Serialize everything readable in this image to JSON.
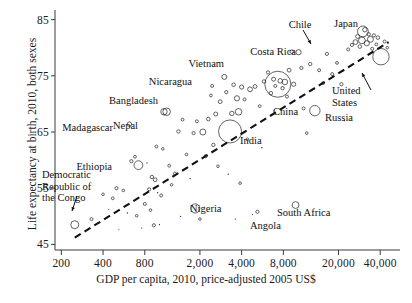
{
  "chart_data": {
    "type": "scatter",
    "title": "",
    "xlabel": "GDP per capita, 2010, price-adjusted 2005 US$",
    "ylabel": "Life expectancy at birth, 2010, both sexes",
    "xscale": "log",
    "xlim": [
      180,
      52000
    ],
    "ylim": [
      44,
      86
    ],
    "xticks": [
      200,
      400,
      800,
      2000,
      4000,
      8000,
      20000,
      40000
    ],
    "xtick_labels": [
      "200",
      "400",
      "800",
      "2,000",
      "4,000",
      "8,000",
      "20,000",
      "40,000"
    ],
    "yticks": [
      45,
      55,
      65,
      75,
      85
    ],
    "ytick_labels": [
      "45",
      "55",
      "65",
      "75",
      "85"
    ],
    "grid": false,
    "legend": null,
    "marker": "open-circle",
    "marker_size_encodes": "population",
    "trendline": {
      "style": "dashed",
      "color": "#111111",
      "x_start": 250,
      "y_start": 46.2,
      "x_end": 46000,
      "y_end": 81.0
    },
    "annotations": [
      {
        "label": "Madagascar",
        "x": 900,
        "y": 66.2,
        "align": "right",
        "leader": false
      },
      {
        "label": "Ethiopia",
        "x": 780,
        "y": 59.5,
        "align": "right",
        "leader": false
      },
      {
        "label": "Democratic Republic of the Congo",
        "x": 250,
        "y": 48.5,
        "align": "right",
        "leader": true
      },
      {
        "label": "Nepal",
        "x": 1150,
        "y": 65.8,
        "align": "right",
        "leader": false
      },
      {
        "label": "Bangladesh",
        "x": 1250,
        "y": 68.5,
        "align": "right",
        "leader": false
      },
      {
        "label": "Nicaragua",
        "x": 2400,
        "y": 73.0,
        "align": "right",
        "leader": false
      },
      {
        "label": "Vietnam",
        "x": 3000,
        "y": 74.8,
        "align": "right",
        "leader": false
      },
      {
        "label": "Costa Rica",
        "x": 9500,
        "y": 79.5,
        "align": "right",
        "leader": false
      },
      {
        "label": "Chile",
        "x": 10500,
        "y": 79.2,
        "align": "center",
        "leader": true
      },
      {
        "label": "Japan",
        "x": 30000,
        "y": 82.9,
        "align": "center",
        "leader": false
      },
      {
        "label": "United States",
        "x": 41000,
        "y": 78.2,
        "align": "left",
        "leader": true
      },
      {
        "label": "Russia",
        "x": 14000,
        "y": 68.8,
        "align": "left",
        "leader": false
      },
      {
        "label": "China",
        "x": 7500,
        "y": 73.5,
        "align": "left",
        "leader": false
      },
      {
        "label": "India",
        "x": 3300,
        "y": 65.1,
        "align": "left",
        "leader": false
      },
      {
        "label": "Nigeria",
        "x": 1900,
        "y": 51.4,
        "align": "left",
        "leader": false
      },
      {
        "label": "South Africa",
        "x": 11000,
        "y": 52.0,
        "align": "left",
        "leader": false
      },
      {
        "label": "Angola",
        "x": 5700,
        "y": 50.7,
        "align": "left",
        "leader": false
      }
    ],
    "labeled_points": [
      {
        "name": "Democratic Republic of the Congo",
        "x": 250,
        "y": 48.5,
        "r": 4.0
      },
      {
        "name": "Ethiopia",
        "x": 720,
        "y": 59.1,
        "r": 4.4
      },
      {
        "name": "Madagascar",
        "x": 620,
        "y": 66.4,
        "r": 2.2
      },
      {
        "name": "Nepal",
        "x": 1150,
        "y": 68.6,
        "r": 3.8
      },
      {
        "name": "Bangladesh",
        "x": 1100,
        "y": 68.6,
        "r": 3.2
      },
      {
        "name": "India",
        "x": 3300,
        "y": 65.1,
        "r": 11.5
      },
      {
        "name": "Nigeria",
        "x": 1850,
        "y": 51.4,
        "r": 4.6
      },
      {
        "name": "Nicaragua",
        "x": 2450,
        "y": 73.2,
        "r": 1.5
      },
      {
        "name": "Vietnam",
        "x": 3000,
        "y": 74.8,
        "r": 2.5
      },
      {
        "name": "China",
        "x": 7300,
        "y": 73.5,
        "r": 13.0
      },
      {
        "name": "Costa Rica",
        "x": 9200,
        "y": 79.3,
        "r": 1.8
      },
      {
        "name": "Chile",
        "x": 10300,
        "y": 79.2,
        "r": 2.6
      },
      {
        "name": "Japan",
        "x": 30000,
        "y": 82.9,
        "r": 5.4
      },
      {
        "name": "United States",
        "x": 40500,
        "y": 78.4,
        "r": 8.2
      },
      {
        "name": "Russia",
        "x": 13500,
        "y": 68.8,
        "r": 5.2
      },
      {
        "name": "South Africa",
        "x": 9800,
        "y": 52.0,
        "r": 3.4
      },
      {
        "name": "Angola",
        "x": 5200,
        "y": 50.8,
        "r": 1.6
      }
    ],
    "points": [
      {
        "x": 250,
        "y": 48.5,
        "r": 4.0
      },
      {
        "x": 330,
        "y": 49.5,
        "r": 1.5
      },
      {
        "x": 400,
        "y": 53.9,
        "r": 1.3
      },
      {
        "x": 440,
        "y": 51.2,
        "r": 1.0
      },
      {
        "x": 470,
        "y": 53.2,
        "r": 1.4
      },
      {
        "x": 500,
        "y": 55.0,
        "r": 1.6
      },
      {
        "x": 520,
        "y": 47.6,
        "r": 1.0
      },
      {
        "x": 560,
        "y": 54.6,
        "r": 1.3
      },
      {
        "x": 600,
        "y": 50.6,
        "r": 1.2
      },
      {
        "x": 620,
        "y": 66.4,
        "r": 2.2
      },
      {
        "x": 640,
        "y": 59.8,
        "r": 1.6
      },
      {
        "x": 680,
        "y": 60.6,
        "r": 1.4
      },
      {
        "x": 700,
        "y": 50.1,
        "r": 1.3
      },
      {
        "x": 720,
        "y": 59.1,
        "r": 4.4
      },
      {
        "x": 760,
        "y": 47.9,
        "r": 1.0
      },
      {
        "x": 800,
        "y": 52.2,
        "r": 1.5
      },
      {
        "x": 830,
        "y": 59.5,
        "r": 1.1
      },
      {
        "x": 860,
        "y": 54.8,
        "r": 1.6
      },
      {
        "x": 880,
        "y": 51.1,
        "r": 1.3
      },
      {
        "x": 900,
        "y": 57.0,
        "r": 1.7
      },
      {
        "x": 930,
        "y": 48.4,
        "r": 1.6
      },
      {
        "x": 950,
        "y": 56.5,
        "r": 1.9
      },
      {
        "x": 970,
        "y": 62.4,
        "r": 1.4
      },
      {
        "x": 990,
        "y": 54.2,
        "r": 1.2
      },
      {
        "x": 1020,
        "y": 48.5,
        "r": 1.1
      },
      {
        "x": 1050,
        "y": 53.7,
        "r": 1.5
      },
      {
        "x": 1080,
        "y": 62.0,
        "r": 1.3
      },
      {
        "x": 1100,
        "y": 68.6,
        "r": 3.2
      },
      {
        "x": 1150,
        "y": 68.6,
        "r": 3.8
      },
      {
        "x": 1200,
        "y": 59.0,
        "r": 1.4
      },
      {
        "x": 1250,
        "y": 55.6,
        "r": 1.3
      },
      {
        "x": 1320,
        "y": 57.6,
        "r": 1.5
      },
      {
        "x": 1400,
        "y": 65.1,
        "r": 1.7
      },
      {
        "x": 1450,
        "y": 50.0,
        "r": 1.2
      },
      {
        "x": 1500,
        "y": 67.2,
        "r": 1.4
      },
      {
        "x": 1600,
        "y": 61.0,
        "r": 1.3
      },
      {
        "x": 1700,
        "y": 56.7,
        "r": 1.2
      },
      {
        "x": 1800,
        "y": 64.8,
        "r": 1.6
      },
      {
        "x": 1850,
        "y": 51.4,
        "r": 4.6
      },
      {
        "x": 1900,
        "y": 66.9,
        "r": 1.5
      },
      {
        "x": 2000,
        "y": 49.5,
        "r": 1.3
      },
      {
        "x": 2100,
        "y": 65.0,
        "r": 3.0
      },
      {
        "x": 2200,
        "y": 60.7,
        "r": 1.6
      },
      {
        "x": 2300,
        "y": 67.3,
        "r": 1.8
      },
      {
        "x": 2400,
        "y": 71.5,
        "r": 1.4
      },
      {
        "x": 2450,
        "y": 73.2,
        "r": 1.5
      },
      {
        "x": 2500,
        "y": 62.7,
        "r": 1.7
      },
      {
        "x": 2600,
        "y": 68.2,
        "r": 2.0
      },
      {
        "x": 2700,
        "y": 58.9,
        "r": 1.3
      },
      {
        "x": 2800,
        "y": 70.4,
        "r": 1.9
      },
      {
        "x": 3000,
        "y": 74.8,
        "r": 2.5
      },
      {
        "x": 3100,
        "y": 72.1,
        "r": 1.6
      },
      {
        "x": 3200,
        "y": 57.5,
        "r": 1.2
      },
      {
        "x": 3300,
        "y": 65.1,
        "r": 11.5
      },
      {
        "x": 3400,
        "y": 68.3,
        "r": 2.2
      },
      {
        "x": 3500,
        "y": 73.4,
        "r": 1.8
      },
      {
        "x": 3600,
        "y": 49.5,
        "r": 1.1
      },
      {
        "x": 3700,
        "y": 71.0,
        "r": 2.6
      },
      {
        "x": 3800,
        "y": 68.6,
        "r": 3.3
      },
      {
        "x": 3900,
        "y": 55.9,
        "r": 1.3
      },
      {
        "x": 4000,
        "y": 73.0,
        "r": 2.1
      },
      {
        "x": 4200,
        "y": 70.8,
        "r": 1.5
      },
      {
        "x": 4400,
        "y": 63.7,
        "r": 1.4
      },
      {
        "x": 4600,
        "y": 72.6,
        "r": 2.4
      },
      {
        "x": 4800,
        "y": 50.3,
        "r": 1.0
      },
      {
        "x": 5000,
        "y": 73.1,
        "r": 1.9
      },
      {
        "x": 5200,
        "y": 50.8,
        "r": 1.6
      },
      {
        "x": 5400,
        "y": 69.6,
        "r": 1.4
      },
      {
        "x": 5600,
        "y": 62.2,
        "r": 1.2
      },
      {
        "x": 5800,
        "y": 74.0,
        "r": 1.7
      },
      {
        "x": 6200,
        "y": 75.6,
        "r": 1.6
      },
      {
        "x": 6500,
        "y": 71.9,
        "r": 1.8
      },
      {
        "x": 6800,
        "y": 74.4,
        "r": 2.0
      },
      {
        "x": 7000,
        "y": 73.2,
        "r": 1.5
      },
      {
        "x": 7300,
        "y": 73.5,
        "r": 13.0
      },
      {
        "x": 7600,
        "y": 74.1,
        "r": 2.3
      },
      {
        "x": 7900,
        "y": 72.8,
        "r": 1.7
      },
      {
        "x": 8200,
        "y": 73.9,
        "r": 2.8
      },
      {
        "x": 8500,
        "y": 71.3,
        "r": 1.5
      },
      {
        "x": 8800,
        "y": 76.0,
        "r": 1.9
      },
      {
        "x": 9200,
        "y": 79.3,
        "r": 1.8
      },
      {
        "x": 9500,
        "y": 73.5,
        "r": 2.1
      },
      {
        "x": 9800,
        "y": 52.0,
        "r": 3.4
      },
      {
        "x": 10300,
        "y": 79.2,
        "r": 2.6
      },
      {
        "x": 10800,
        "y": 76.4,
        "r": 1.6
      },
      {
        "x": 11200,
        "y": 69.2,
        "r": 1.5
      },
      {
        "x": 11800,
        "y": 64.8,
        "r": 1.3
      },
      {
        "x": 12500,
        "y": 77.1,
        "r": 1.7
      },
      {
        "x": 13500,
        "y": 68.8,
        "r": 5.2
      },
      {
        "x": 14500,
        "y": 76.0,
        "r": 1.5
      },
      {
        "x": 15500,
        "y": 73.7,
        "r": 1.4
      },
      {
        "x": 16500,
        "y": 78.9,
        "r": 1.6
      },
      {
        "x": 18000,
        "y": 75.3,
        "r": 1.5
      },
      {
        "x": 19500,
        "y": 77.3,
        "r": 1.4
      },
      {
        "x": 21000,
        "y": 73.5,
        "r": 1.6
      },
      {
        "x": 22000,
        "y": 67.0,
        "r": 1.2
      },
      {
        "x": 23500,
        "y": 79.7,
        "r": 1.5
      },
      {
        "x": 25000,
        "y": 80.5,
        "r": 1.6
      },
      {
        "x": 26500,
        "y": 81.0,
        "r": 2.4
      },
      {
        "x": 27500,
        "y": 82.0,
        "r": 2.0
      },
      {
        "x": 28500,
        "y": 80.2,
        "r": 1.8
      },
      {
        "x": 29500,
        "y": 81.3,
        "r": 3.4
      },
      {
        "x": 30000,
        "y": 82.9,
        "r": 5.4
      },
      {
        "x": 31000,
        "y": 83.2,
        "r": 2.2
      },
      {
        "x": 32000,
        "y": 80.8,
        "r": 2.6
      },
      {
        "x": 33000,
        "y": 82.4,
        "r": 1.7
      },
      {
        "x": 34000,
        "y": 81.5,
        "r": 3.0
      },
      {
        "x": 35000,
        "y": 79.8,
        "r": 1.5
      },
      {
        "x": 36000,
        "y": 82.2,
        "r": 1.6
      },
      {
        "x": 37500,
        "y": 80.6,
        "r": 1.4
      },
      {
        "x": 38500,
        "y": 81.8,
        "r": 1.8
      },
      {
        "x": 40500,
        "y": 78.4,
        "r": 8.2
      },
      {
        "x": 43000,
        "y": 81.1,
        "r": 1.5
      },
      {
        "x": 45000,
        "y": 80.0,
        "r": 1.3
      }
    ]
  },
  "axis": {
    "x_title": "GDP per capita, 2010, price-adjusted 2005 US$",
    "y_title": "Life expectancy at birth, 2010, both sexes"
  },
  "colors": {
    "axis": "#3a3a3a",
    "marker": "#222222",
    "trend": "#111111",
    "text": "#111111",
    "background": "#ffffff"
  }
}
